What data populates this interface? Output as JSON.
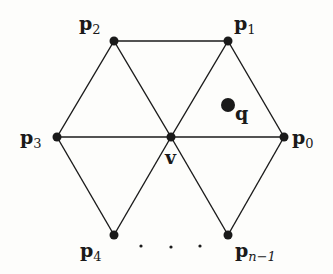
{
  "diagram": {
    "colors": {
      "stroke": "#1a1a1a",
      "background": "#fdfdfb"
    },
    "vertices": [
      {
        "id": "p0",
        "label": "p",
        "sub": "0",
        "x": 284,
        "y": 137
      },
      {
        "id": "p1",
        "label": "p",
        "sub": "1",
        "x": 228,
        "y": 41
      },
      {
        "id": "p2",
        "label": "p",
        "sub": "2",
        "x": 114,
        "y": 41
      },
      {
        "id": "p3",
        "label": "p",
        "sub": "3",
        "x": 57,
        "y": 137
      },
      {
        "id": "p4",
        "label": "p",
        "sub": "4",
        "x": 114,
        "y": 235
      },
      {
        "id": "pn1",
        "label": "p",
        "sub": "n−1",
        "x": 228,
        "y": 235
      },
      {
        "id": "v",
        "label": "v",
        "sub": "",
        "x": 171,
        "y": 137
      }
    ],
    "query_point": {
      "id": "q",
      "label": "q",
      "x": 228,
      "y": 105
    },
    "ellipsis": "· · ·",
    "edges": [
      [
        "p2",
        "p1"
      ],
      [
        "p3",
        "p0"
      ],
      [
        "p2",
        "p3"
      ],
      [
        "p2",
        "v"
      ],
      [
        "p1",
        "v"
      ],
      [
        "p1",
        "p0"
      ],
      [
        "p3",
        "p4"
      ],
      [
        "p4",
        "v"
      ],
      [
        "v",
        "pn1"
      ],
      [
        "pn1",
        "p0"
      ]
    ]
  }
}
